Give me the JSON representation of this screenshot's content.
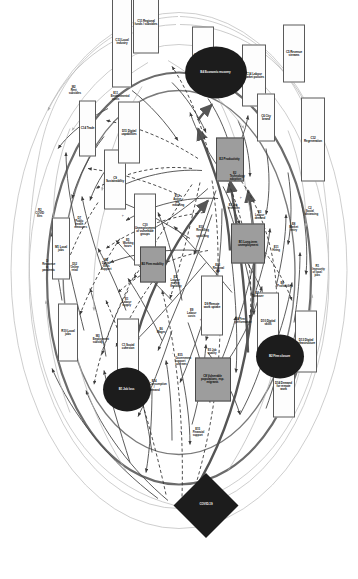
{
  "diagram": {
    "orientation": "rotated-90",
    "colors": {
      "background": "#ffffff",
      "box_stroke": "#5a5a5a",
      "hub_fill": "#9d9d9d",
      "dark_fill": "#1c1c1c",
      "edge_dark": "#3c3c3c",
      "edge_light": "#b9b9b9",
      "edge_heavy": "#555555"
    },
    "legend": {
      "dashed": "dashed edge",
      "solid": "solid edge",
      "thick": "thick edge"
    }
  },
  "nodes": [
    {
      "id": "n01",
      "kind": "box",
      "label": "C13 Local industry",
      "x": 41,
      "y": 236,
      "w": 92,
      "h": 20
    },
    {
      "id": "n02",
      "kind": "box",
      "label": "C14 Trade",
      "x": 128,
      "y": 270,
      "w": 56,
      "h": 17
    },
    {
      "id": "n03",
      "kind": "box",
      "label": "C9 Sustainability",
      "x": 179,
      "y": 243,
      "w": 60,
      "h": 22
    },
    {
      "id": "n04",
      "kind": "box",
      "label": "C10 Unemployment of vulnerable groups",
      "x": 229,
      "y": 213,
      "w": 72,
      "h": 22
    },
    {
      "id": "n05",
      "kind": "box",
      "label": "M1 Local jobs",
      "x": 248,
      "y": 297,
      "w": 62,
      "h": 18
    },
    {
      "id": "n06",
      "kind": "box",
      "label": "R10 Local jobs",
      "x": 332,
      "y": 290,
      "w": 58,
      "h": 20
    },
    {
      "id": "n07",
      "kind": "box",
      "label": "C12 Regeneration",
      "x": 139,
      "y": 45,
      "w": 84,
      "h": 24
    },
    {
      "id": "n08",
      "kind": "box",
      "label": "C14 Labour market policies",
      "x": 75,
      "y": 104,
      "w": 62,
      "h": 24
    },
    {
      "id": "n09",
      "kind": "box",
      "label": "C5 Revenue streams",
      "x": 53,
      "y": 64,
      "w": 58,
      "h": 22
    },
    {
      "id": "n10",
      "kind": "box",
      "label": "C7 Contingency plans",
      "x": 55,
      "y": 155,
      "w": 58,
      "h": 22
    },
    {
      "id": "n11",
      "kind": "box",
      "label": "C11 Regional funds / subsidies",
      "x": 22,
      "y": 212,
      "w": 62,
      "h": 26
    },
    {
      "id": "n12",
      "kind": "box",
      "label": "C6 City brand",
      "x": 117,
      "y": 92,
      "w": 48,
      "h": 18
    },
    {
      "id": "n13",
      "kind": "box",
      "label": "D11 Digital capabilities",
      "x": 132,
      "y": 229,
      "w": 62,
      "h": 22
    },
    {
      "id": "n14",
      "kind": "box",
      "label": "C1 Social cohesion",
      "x": 346,
      "y": 230,
      "w": 56,
      "h": 22
    },
    {
      "id": "n15",
      "kind": "box",
      "label": "D10 Digital skills",
      "x": 322,
      "y": 90,
      "w": 60,
      "h": 22
    },
    {
      "id": "n16",
      "kind": "box",
      "label": "D13 Digital infrastructure",
      "x": 341,
      "y": 52,
      "w": 62,
      "h": 22
    },
    {
      "id": "n17",
      "kind": "box",
      "label": "D14 Demand for remote work",
      "x": 386,
      "y": 74,
      "w": 62,
      "h": 22
    },
    {
      "id": "n18",
      "kind": "box",
      "label": "D9 Remote work uptake",
      "x": 305,
      "y": 146,
      "w": 60,
      "h": 22
    },
    {
      "id": "h01",
      "kind": "hub",
      "label": "E2 Productivity",
      "x": 159,
      "y": 128,
      "w": 44,
      "h": 28
    },
    {
      "id": "h02",
      "kind": "hub",
      "label": "B1 Long-term unemployment",
      "x": 243,
      "y": 110,
      "w": 40,
      "h": 34
    },
    {
      "id": "h03",
      "kind": "hub",
      "label": "B3 Firm mobility",
      "x": 264,
      "y": 205,
      "w": 36,
      "h": 26
    },
    {
      "id": "h04",
      "kind": "hub",
      "label": "C8 Vulnerable populations, esp. migrants",
      "x": 379,
      "y": 145,
      "w": 44,
      "h": 36
    },
    {
      "id": "e01",
      "kind": "ellipse",
      "label": "B4 Economic recovery",
      "x": 72,
      "y": 142,
      "w": 52,
      "h": 62
    },
    {
      "id": "e02",
      "kind": "ellipse",
      "label": "B2 Firm closure",
      "x": 356,
      "y": 78,
      "w": 44,
      "h": 48
    },
    {
      "id": "e03",
      "kind": "ellipse",
      "label": "B1 Job loss",
      "x": 389,
      "y": 231,
      "w": 44,
      "h": 48
    },
    {
      "id": "d01",
      "kind": "diamond",
      "label": "COVID-19",
      "x": 505,
      "y": 152,
      "w": 46,
      "h": 46
    },
    {
      "id": "t01",
      "kind": "text",
      "label": "E11 Environmental costs",
      "x": 96,
      "y": 242,
      "w": 58,
      "h": 12
    },
    {
      "id": "t02",
      "kind": "text",
      "label": "M2 Rent subsidies",
      "x": 90,
      "y": 284,
      "w": 46,
      "h": 12
    },
    {
      "id": "t03",
      "kind": "text",
      "label": "E2 Technology adoption",
      "x": 176,
      "y": 123,
      "w": 60,
      "h": 12
    },
    {
      "id": "t04",
      "kind": "text",
      "label": "E12 Active job matching",
      "x": 200,
      "y": 181,
      "w": 56,
      "h": 12
    },
    {
      "id": "t05",
      "kind": "text",
      "label": "E10 Reskilling / upskilling",
      "x": 231,
      "y": 157,
      "w": 56,
      "h": 12
    },
    {
      "id": "t06",
      "kind": "text",
      "label": "E13 Regional aid",
      "x": 268,
      "y": 140,
      "w": 46,
      "h": 12
    },
    {
      "id": "t07",
      "kind": "text",
      "label": "E1 Labour market flexibility",
      "x": 281,
      "y": 183,
      "w": 56,
      "h": 12
    },
    {
      "id": "t08",
      "kind": "text",
      "label": "E5 Working hours",
      "x": 243,
      "y": 230,
      "w": 48,
      "h": 12
    },
    {
      "id": "t09",
      "kind": "text",
      "label": "E9 Labour costs",
      "x": 313,
      "y": 166,
      "w": 48,
      "h": 12
    },
    {
      "id": "t10",
      "kind": "text",
      "label": "E6 Wages",
      "x": 330,
      "y": 197,
      "w": 38,
      "h": 12
    },
    {
      "id": "t11",
      "kind": "text",
      "label": "E1 Labour supply",
      "x": 302,
      "y": 231,
      "w": 48,
      "h": 12
    },
    {
      "id": "t12",
      "kind": "text",
      "label": "E3 Job quality",
      "x": 351,
      "y": 146,
      "w": 44,
      "h": 12
    },
    {
      "id": "t13",
      "kind": "text",
      "label": "E15 Government support schemes",
      "x": 359,
      "y": 178,
      "w": 56,
      "h": 12
    },
    {
      "id": "t14",
      "kind": "text",
      "label": "E14 Consumption / demand",
      "x": 385,
      "y": 204,
      "w": 52,
      "h": 12
    },
    {
      "id": "t15",
      "kind": "text",
      "label": "E15 Financial support",
      "x": 432,
      "y": 160,
      "w": 50,
      "h": 12
    },
    {
      "id": "t16",
      "kind": "text",
      "label": "E4 Firm performance",
      "x": 320,
      "y": 118,
      "w": 46,
      "h": 12
    },
    {
      "id": "t17",
      "kind": "text",
      "label": "E7 Turnover",
      "x": 294,
      "y": 101,
      "w": 40,
      "h": 12
    },
    {
      "id": "t18",
      "kind": "text",
      "label": "E8 Profitability",
      "x": 284,
      "y": 76,
      "w": 42,
      "h": 12
    },
    {
      "id": "t19",
      "kind": "text",
      "label": "E11 Hiring",
      "x": 248,
      "y": 82,
      "w": 38,
      "h": 12
    },
    {
      "id": "t20",
      "kind": "text",
      "label": "E8 Market entry",
      "x": 227,
      "y": 64,
      "w": 44,
      "h": 12
    },
    {
      "id": "t21",
      "kind": "text",
      "label": "E3 Labour demand",
      "x": 215,
      "y": 98,
      "w": 46,
      "h": 12
    },
    {
      "id": "t22",
      "kind": "text",
      "label": "E1 Job retention",
      "x": 206,
      "y": 125,
      "w": 44,
      "h": 12
    },
    {
      "id": "t23",
      "kind": "text",
      "label": "M3 Employment subsidy",
      "x": 339,
      "y": 260,
      "w": 52,
      "h": 12
    },
    {
      "id": "t24",
      "kind": "text",
      "label": "M2 Digital skills support",
      "x": 264,
      "y": 252,
      "w": 50,
      "h": 12
    },
    {
      "id": "t25",
      "kind": "text",
      "label": "D12 Online retail",
      "x": 267,
      "y": 283,
      "w": 46,
      "h": 12
    },
    {
      "id": "t26",
      "kind": "text",
      "label": "D7 Public health measures",
      "x": 222,
      "y": 279,
      "w": 50,
      "h": 12
    },
    {
      "id": "t27",
      "kind": "text",
      "label": "R1 Insecurity of local jobs",
      "x": 270,
      "y": 41,
      "w": 52,
      "h": 12
    },
    {
      "id": "t28",
      "kind": "text",
      "label": "R2 COVID files",
      "x": 213,
      "y": 318,
      "w": 46,
      "h": 12
    },
    {
      "id": "t29",
      "kind": "text",
      "label": "D Response to pandemic",
      "x": 265,
      "y": 311,
      "w": 50,
      "h": 12
    },
    {
      "id": "t30",
      "kind": "text",
      "label": "C2 Social distancing",
      "x": 211,
      "y": 48,
      "w": 48,
      "h": 12
    }
  ],
  "edges": {
    "counts": {
      "solid": 78,
      "dashed": 22,
      "heavy": 10,
      "light": 18
    }
  }
}
